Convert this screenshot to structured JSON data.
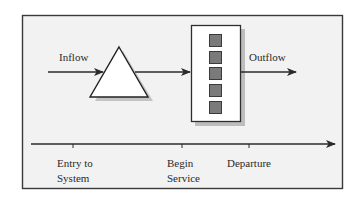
{
  "diagram": {
    "colors": {
      "frame_bg": "#f2f2f2",
      "frame_border": "#3a3a3a",
      "line": "#2b2b2b",
      "shadow": "#bdbdbd",
      "server_square": "#7a7a7a",
      "node_fill": "#ffffff"
    },
    "flow": {
      "inflow_label": "Inflow",
      "outflow_label": "Outflow"
    },
    "nodes": [
      {
        "id": "queue",
        "shape": "triangle",
        "label": ""
      },
      {
        "id": "server",
        "shape": "rectangle",
        "label": "",
        "squares": 5
      }
    ],
    "timeline": {
      "events": [
        {
          "line1": "Entry to",
          "line2": "System"
        },
        {
          "line1": "Begin",
          "line2": "Service"
        },
        {
          "line1": "Departure",
          "line2": ""
        }
      ]
    }
  }
}
